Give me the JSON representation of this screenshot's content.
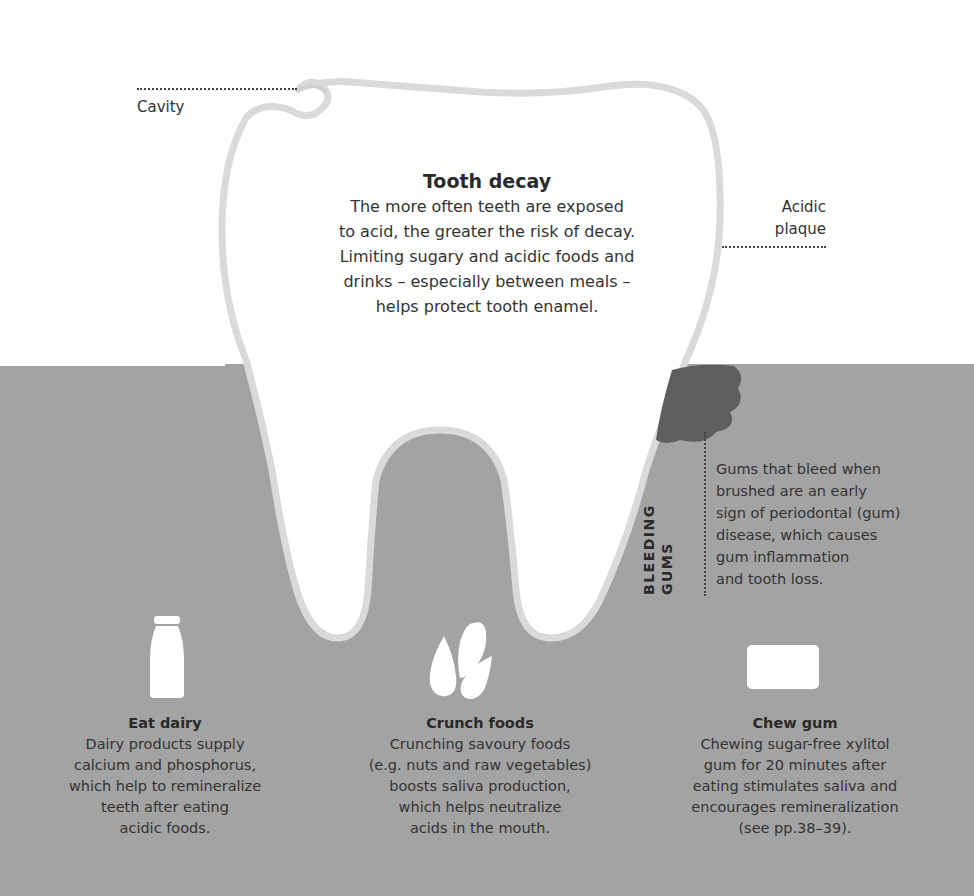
{
  "labels": {
    "cavity": "Cavity",
    "acidic_plaque_line1": "Acidic",
    "acidic_plaque_line2": "plaque"
  },
  "tooth_decay": {
    "title": "Tooth decay",
    "lines": [
      "The more often teeth are exposed",
      "to acid, the greater the risk of decay.",
      "Limiting sugary and acidic foods and",
      "drinks – especially between meals –",
      "helps protect tooth enamel."
    ]
  },
  "bleeding_gums": {
    "title_line1": "BLEEDING",
    "title_line2": "GUMS",
    "lines": [
      "Gums that bleed when",
      "brushed are an early",
      "sign of periodontal (gum)",
      "disease, which causes",
      "gum inflammation",
      "and tooth loss."
    ]
  },
  "tips": [
    {
      "icon": "milk-bottle-icon",
      "title": "Eat dairy",
      "lines": [
        "Dairy products supply",
        "calcium and phosphorus,",
        "which help to remineralize",
        "teeth after eating",
        "acidic foods."
      ]
    },
    {
      "icon": "seeds-icon",
      "title": "Crunch foods",
      "lines": [
        "Crunching savoury foods",
        "(e.g. nuts and raw vegetables)",
        "boosts saliva production,",
        "which helps neutralize",
        "acids in the mouth."
      ]
    },
    {
      "icon": "gum-stick-icon",
      "title": "Chew gum",
      "lines": [
        "Chewing sugar-free xylitol",
        "gum for 20 minutes after",
        "eating stimulates saliva and",
        "encourages remineralization",
        "(see pp.38–39)."
      ]
    }
  ],
  "colors": {
    "gum": "#a3a3a3",
    "plaque": "#5e5e5e",
    "tooth": "#ffffff",
    "tooth_outline": "#d8d8d8",
    "text": "#2a2a2a"
  }
}
